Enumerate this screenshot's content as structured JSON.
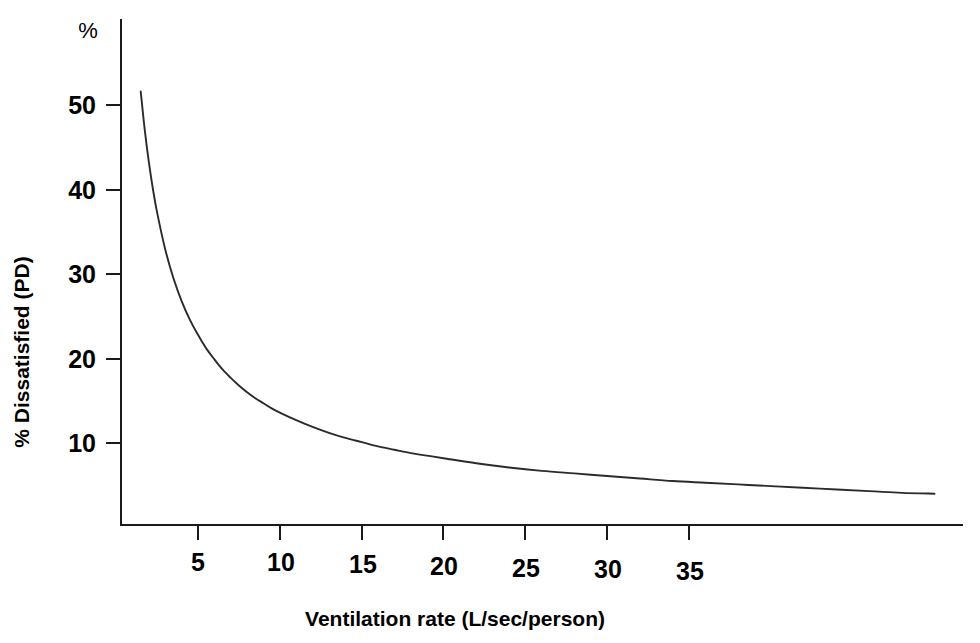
{
  "chart_data": {
    "type": "line",
    "title": "",
    "subtitle": "",
    "xlabel": "Ventilation rate (L/sec/person)",
    "ylabel": "% Dissatisfied (PD)",
    "y_unit_label": "%",
    "xlim": [
      0,
      51.5
    ],
    "ylim": [
      0,
      59
    ],
    "grid": false,
    "legend": null,
    "x_ticks": [
      5,
      10,
      15,
      20,
      25,
      30,
      35
    ],
    "x_tick_labels": [
      "5",
      "10",
      "15",
      "20",
      "25",
      "30",
      "35"
    ],
    "y_ticks": [
      10,
      20,
      30,
      40,
      50
    ],
    "y_tick_labels": [
      "10",
      "20",
      "30",
      "40",
      "50"
    ],
    "series": [
      {
        "name": "Percentage dissatisfied",
        "x": [
          1.5,
          1.75,
          2,
          2.25,
          2.5,
          3,
          3.5,
          4,
          4.5,
          5,
          5.5,
          6,
          6.5,
          7,
          7.5,
          8,
          8.5,
          9,
          9.5,
          10,
          11,
          12,
          13,
          14,
          15,
          16,
          17,
          18,
          19,
          20,
          22,
          24,
          26,
          28,
          30,
          32,
          34,
          36,
          38,
          40,
          43,
          46,
          48,
          50
        ],
        "y": [
          51.6,
          47.0,
          43.2,
          40.0,
          37.3,
          32.9,
          29.5,
          26.8,
          24.6,
          22.8,
          21.2,
          19.9,
          18.7,
          17.7,
          16.8,
          16.0,
          15.3,
          14.7,
          14.1,
          13.6,
          12.7,
          11.9,
          11.2,
          10.6,
          10.1,
          9.6,
          9.2,
          8.8,
          8.5,
          8.2,
          7.6,
          7.1,
          6.7,
          6.4,
          6.1,
          5.8,
          5.5,
          5.3,
          5.1,
          4.9,
          4.6,
          4.3,
          4.1,
          4.0
        ]
      }
    ]
  },
  "axis": {
    "x_title": "Ventilation rate (L/sec/person)",
    "y_title": "% Dissatisfied (PD)",
    "y_unit": "%"
  },
  "ticks": {
    "x": [
      "5",
      "10",
      "15",
      "20",
      "25",
      "30",
      "35"
    ],
    "y": [
      "50",
      "40",
      "30",
      "20",
      "10"
    ]
  },
  "colors": {
    "curve": "#2b2b2b",
    "axis": "#1a1a1a",
    "background": "#ffffff",
    "text": "#000000"
  }
}
